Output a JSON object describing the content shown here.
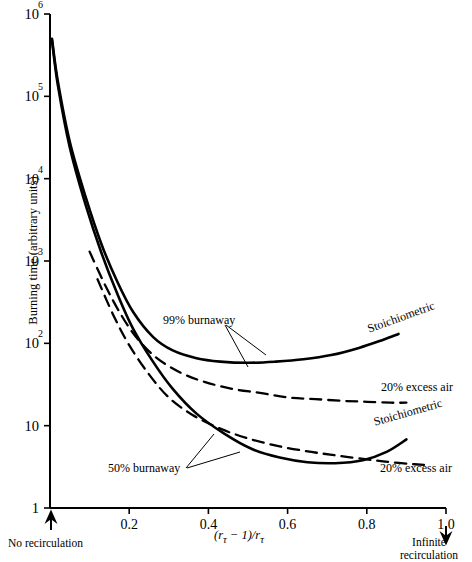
{
  "chart_data": {
    "type": "line",
    "title": "",
    "xlabel": "(rτ − 1)/rτ",
    "ylabel": "Burning time (arbitrary units)",
    "xlim": [
      0,
      1.0
    ],
    "ylim": [
      1,
      1000000
    ],
    "yscale": "log",
    "grid": false,
    "legend_position": "inline-annotations",
    "xticks": [
      "0.2",
      "0.4",
      "0.6",
      "0.8",
      "1.0"
    ],
    "xtick_values": [
      0.2,
      0.4,
      0.6,
      0.8,
      1.0
    ],
    "yticks": [
      "1",
      "10",
      "10^2",
      "10^3",
      "10^4",
      "10^5",
      "10^6"
    ],
    "ytick_values": [
      1,
      10,
      100,
      1000,
      10000,
      100000,
      1000000
    ],
    "series": [
      {
        "name": "99% burnaway — Stoichiometric",
        "style": "solid",
        "group": "99% burnaway",
        "x": [
          0.005,
          0.02,
          0.05,
          0.09,
          0.13,
          0.17,
          0.21,
          0.26,
          0.31,
          0.37,
          0.43,
          0.5,
          0.57,
          0.64,
          0.71,
          0.78,
          0.84,
          0.88
        ],
        "y": [
          500000,
          150000,
          28000,
          6000,
          1600,
          560,
          240,
          120,
          82,
          66,
          60,
          58,
          60,
          64,
          72,
          88,
          110,
          130
        ]
      },
      {
        "name": "99% burnaway — 20% excess air",
        "style": "dashed",
        "group": "99% burnaway",
        "x": [
          0.1,
          0.14,
          0.18,
          0.22,
          0.27,
          0.33,
          0.39,
          0.46,
          0.53,
          0.6,
          0.67,
          0.74,
          0.8,
          0.86,
          0.9
        ],
        "y": [
          1300,
          500,
          220,
          115,
          66,
          44,
          34,
          28,
          25,
          22,
          21,
          20,
          19.5,
          19,
          19
        ]
      },
      {
        "name": "50% burnaway — Stoichiometric",
        "style": "solid",
        "group": "50% burnaway",
        "x": [
          0.005,
          0.02,
          0.05,
          0.09,
          0.13,
          0.17,
          0.21,
          0.26,
          0.31,
          0.37,
          0.44,
          0.51,
          0.58,
          0.65,
          0.72,
          0.79,
          0.85,
          0.9
        ],
        "y": [
          480000,
          135000,
          24000,
          4800,
          1250,
          400,
          150,
          60,
          28,
          14,
          8.0,
          5.2,
          4.1,
          3.6,
          3.5,
          3.8,
          4.8,
          6.8
        ]
      },
      {
        "name": "50% burnaway — 20% excess air",
        "style": "dashed",
        "group": "50% burnaway",
        "x": [
          0.12,
          0.16,
          0.2,
          0.25,
          0.3,
          0.36,
          0.43,
          0.5,
          0.58,
          0.66,
          0.73,
          0.8,
          0.86,
          0.92,
          0.96
        ],
        "y": [
          600,
          220,
          95,
          42,
          22,
          13.5,
          9.2,
          7.0,
          5.6,
          4.8,
          4.3,
          3.9,
          3.6,
          3.4,
          3.3
        ]
      }
    ],
    "annotations": [
      {
        "text": "99% burnaway",
        "x": 0.3,
        "y": 190
      },
      {
        "text": "50% burnaway",
        "x": 0.22,
        "y": 2.6
      },
      {
        "text": "Stoichiometric",
        "x": 0.885,
        "y": 165
      },
      {
        "text": "20% excess air",
        "x": 0.885,
        "y": 21
      },
      {
        "text": "Stoichiometric",
        "x": 0.885,
        "y": 11
      },
      {
        "text": "20% excess air",
        "x": 0.885,
        "y": 3.0
      }
    ]
  },
  "axis": {
    "y_title": "Burning time (arbitrary units)",
    "x_title_prefix": "(r",
    "x_title_sub1": "τ",
    "x_title_mid": " − 1)/r",
    "x_title_sub2": "τ",
    "x_ticks": [
      {
        "label": "0.2",
        "value": 0.2
      },
      {
        "label": "0.4",
        "value": 0.4
      },
      {
        "label": "0.6",
        "value": 0.6
      },
      {
        "label": "0.8",
        "value": 0.8
      },
      {
        "label": "1.0",
        "value": 1.0
      }
    ],
    "y_ticks": [
      {
        "mantissa": "10",
        "exp": "6",
        "value": 1000000
      },
      {
        "mantissa": "10",
        "exp": "5",
        "value": 100000
      },
      {
        "mantissa": "10",
        "exp": "4",
        "value": 10000
      },
      {
        "mantissa": "10",
        "exp": "3",
        "value": 1000
      },
      {
        "mantissa": "10",
        "exp": "2",
        "value": 100
      },
      {
        "mantissa": "10",
        "exp": "",
        "value": 10
      },
      {
        "mantissa": "1",
        "exp": "",
        "value": 1
      }
    ]
  },
  "endpoints": {
    "left_line1": "No recirculation",
    "right_line1": "Infinite",
    "right_line2": "recirculation"
  },
  "curve_labels": {
    "burnaway_99": "99% burnaway",
    "burnaway_50": "50% burnaway",
    "stoichiometric_upper": "Stoichiometric",
    "excess_air_upper": "20% excess air",
    "stoichiometric_lower": "Stoichiometric",
    "excess_air_lower": "20% excess air"
  },
  "colors": {
    "ink": "#000000",
    "background": "#ffffff"
  }
}
